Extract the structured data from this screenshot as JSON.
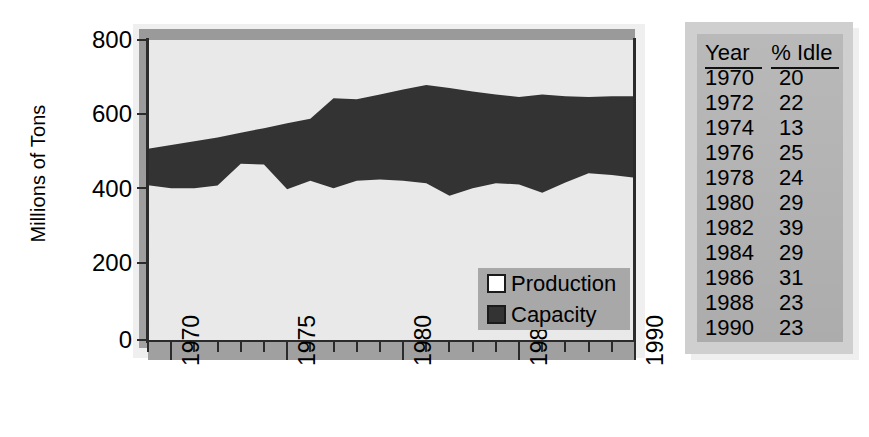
{
  "chart_data": {
    "type": "area",
    "title": "",
    "xlabel": "",
    "ylabel": "Millions of Tons",
    "xlim": [
      1969,
      1990
    ],
    "ylim": [
      0,
      800
    ],
    "ytick_labels": [
      "800",
      "600",
      "400",
      "200",
      "0"
    ],
    "ytick_values": [
      800,
      600,
      400,
      200,
      0
    ],
    "xtick_labels": [
      "1970",
      "1975",
      "1980",
      "1985",
      "1990"
    ],
    "xtick_values": [
      1970,
      1975,
      1980,
      1985,
      1990
    ],
    "grid": false,
    "legend_position": "inside-bottom-right",
    "stacking": "overlay",
    "x": [
      1969,
      1970,
      1971,
      1972,
      1973,
      1974,
      1975,
      1976,
      1977,
      1978,
      1979,
      1980,
      1981,
      1982,
      1983,
      1984,
      1985,
      1986,
      1987,
      1988,
      1989,
      1990
    ],
    "series": [
      {
        "name": "Capacity",
        "color": "#333333",
        "values": [
          510,
          520,
          530,
          540,
          553,
          565,
          578,
          590,
          645,
          642,
          655,
          668,
          680,
          672,
          663,
          655,
          648,
          655,
          650,
          648,
          650,
          650
        ]
      },
      {
        "name": "Production",
        "color": "#e9e9e9",
        "values": [
          413,
          405,
          405,
          412,
          470,
          468,
          402,
          425,
          405,
          425,
          428,
          425,
          418,
          385,
          405,
          418,
          415,
          393,
          420,
          445,
          440,
          433
        ]
      }
    ]
  },
  "legend": {
    "items": [
      {
        "label": "Production",
        "swatch": "white"
      },
      {
        "label": "Capacity",
        "swatch": "dark"
      }
    ]
  },
  "table": {
    "headers": [
      "Year",
      "% Idle"
    ],
    "rows": [
      {
        "year": "1970",
        "idle": "20"
      },
      {
        "year": "1972",
        "idle": "22"
      },
      {
        "year": "1974",
        "idle": "13"
      },
      {
        "year": "1976",
        "idle": "25"
      },
      {
        "year": "1978",
        "idle": "24"
      },
      {
        "year": "1980",
        "idle": "29"
      },
      {
        "year": "1982",
        "idle": "39"
      },
      {
        "year": "1984",
        "idle": "29"
      },
      {
        "year": "1986",
        "idle": "31"
      },
      {
        "year": "1988",
        "idle": "23"
      },
      {
        "year": "1990",
        "idle": "23"
      }
    ]
  },
  "colors": {
    "capacity": "#333333",
    "production": "#e9e9e9",
    "plot_bg": "#e9e9e9",
    "backdrop": "#9c9c9c",
    "panel": "#b4b4b4",
    "axis": "#2b2b2b"
  }
}
